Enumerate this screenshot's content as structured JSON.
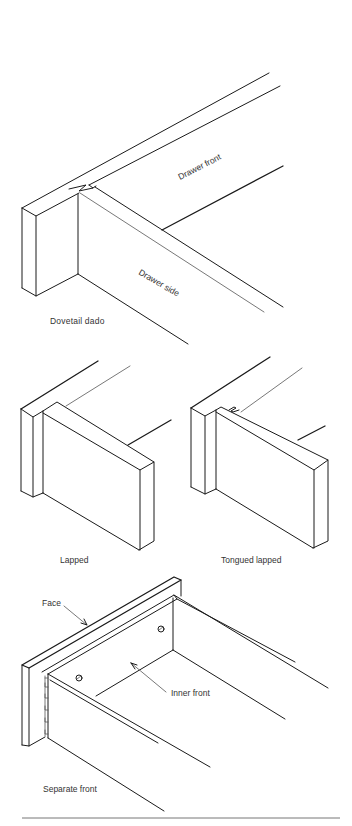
{
  "figure": {
    "type": "woodworking-drawer-joints-illustration",
    "line_color": "#1a1a1a",
    "background": "#ffffff"
  },
  "panels": [
    {
      "id": "dovetail-dado",
      "caption": "Dovetail dado",
      "labels": {
        "front": "Drawer front",
        "side": "Drawer side"
      }
    },
    {
      "id": "lapped",
      "caption": "Lapped"
    },
    {
      "id": "tongued-lapped",
      "caption": "Tongued lapped"
    },
    {
      "id": "separate-front",
      "caption": "Separate front",
      "labels": {
        "face": "Face",
        "inner_front": "Inner front"
      }
    }
  ]
}
